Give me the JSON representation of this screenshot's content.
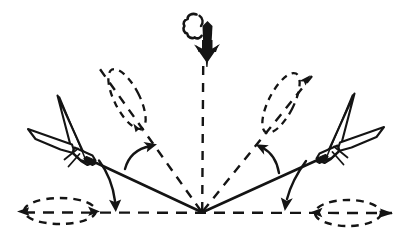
{
  "figure": {
    "title": "Aircraft fan break / dispersal maneuver diagram",
    "background_color": "#ffffff",
    "ink_color": "#141414",
    "labels": []
  },
  "geometry": {
    "convergence_point": {
      "x": 202,
      "y": 213
    },
    "canvas": {
      "width": 410,
      "height": 251
    }
  },
  "elements": {
    "threat_arrow": {
      "name": "descending-threat-arrow",
      "direction": "down",
      "tip": {
        "x": 203,
        "y": 62
      },
      "tail": {
        "x": 203,
        "y": 18
      },
      "smoke_puff": {
        "x": 190,
        "y": 26
      }
    },
    "vertical_reference": {
      "name": "vertical-dashed-reference-line",
      "style": "dashed",
      "from": {
        "x": 203,
        "y": 66
      },
      "to": {
        "x": 202,
        "y": 213
      }
    },
    "horizontal_reference": {
      "name": "horizontal-dashed-ground-line",
      "style": "dashed",
      "from": {
        "x": 18,
        "y": 213
      },
      "to": {
        "x": 392,
        "y": 213
      }
    },
    "dashed_rays": [
      {
        "name": "dashed-ray-left",
        "from": {
          "x": 202,
          "y": 213
        },
        "to": {
          "x": 99,
          "y": 68
        }
      },
      {
        "name": "dashed-ray-right",
        "from": {
          "x": 202,
          "y": 213
        },
        "to": {
          "x": 312,
          "y": 76
        }
      }
    ],
    "solid_tracks": [
      {
        "name": "solid-track-left",
        "from": {
          "x": 202,
          "y": 213
        },
        "to": {
          "x": 58,
          "y": 146
        }
      },
      {
        "name": "solid-track-right",
        "from": {
          "x": 202,
          "y": 213
        },
        "to": {
          "x": 344,
          "y": 148
        }
      }
    ],
    "aircraft": [
      {
        "name": "aircraft-left-banked",
        "view": "rear-quarter banked jet silhouette",
        "position": {
          "x": 68,
          "y": 128
        },
        "bank": "left"
      },
      {
        "name": "aircraft-right-banked",
        "view": "rear-quarter banked jet silhouette",
        "position": {
          "x": 336,
          "y": 130
        },
        "bank": "right"
      }
    ],
    "ground_tracks": [
      {
        "name": "ground-track-ellipse-left",
        "style": "dashed",
        "center": {
          "x": 60,
          "y": 211
        },
        "rx": 36,
        "ry": 13,
        "rotation": 0
      },
      {
        "name": "ground-track-ellipse-right",
        "style": "dashed",
        "center": {
          "x": 348,
          "y": 213
        },
        "rx": 33,
        "ry": 13,
        "rotation": 0
      },
      {
        "name": "climb-track-ellipse-left",
        "style": "dashed",
        "center": {
          "x": 127,
          "y": 98
        },
        "rx": 12,
        "ry": 33,
        "rotation": -28
      },
      {
        "name": "climb-track-ellipse-right",
        "style": "dashed",
        "center": {
          "x": 281,
          "y": 102
        },
        "rx": 12,
        "ry": 33,
        "rotation": 28
      }
    ],
    "angle_arrows": [
      {
        "name": "turn-arc-left-upper",
        "description": "curved arrow from solid left track up to dashed left ray",
        "arrowhead_at": {
          "x": 153,
          "y": 144
        }
      },
      {
        "name": "turn-arc-left-lower",
        "description": "curved arrow from solid left track down to horizontal ground line",
        "arrowhead_at": {
          "x": 115,
          "y": 210
        }
      },
      {
        "name": "turn-arc-right-upper",
        "description": "curved arrow from solid right track up to dashed right ray",
        "arrowhead_at": {
          "x": 258,
          "y": 148
        }
      },
      {
        "name": "turn-arc-right-lower",
        "description": "curved arrow from solid right track down to horizontal ground line",
        "arrowhead_at": {
          "x": 285,
          "y": 208
        }
      }
    ],
    "line_arrowheads": [
      {
        "name": "ground-line-arrowhead-left",
        "x": 22,
        "y": 211,
        "direction": "left"
      },
      {
        "name": "ground-line-arrowhead-right",
        "x": 384,
        "y": 213,
        "direction": "right"
      },
      {
        "name": "ellipse-tip-arrowhead-left",
        "x": 96,
        "y": 211,
        "direction": "right"
      },
      {
        "name": "ellipse-tip-arrowhead-right",
        "x": 313,
        "y": 213,
        "direction": "left"
      },
      {
        "name": "climb-ellipse-arrowhead-left",
        "x": 139,
        "y": 128,
        "direction": "down-right"
      },
      {
        "name": "climb-ellipse-arrowhead-right",
        "x": 307,
        "y": 79,
        "direction": "up-right"
      }
    ]
  }
}
